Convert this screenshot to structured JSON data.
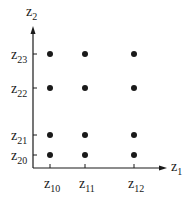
{
  "diagram": {
    "type": "grid-point-lattice",
    "axes": {
      "x": {
        "label_base": "z",
        "label_sub": "1"
      },
      "y": {
        "label_base": "z",
        "label_sub": "2"
      }
    },
    "x_ticks": [
      {
        "base": "z",
        "sub": "10"
      },
      {
        "base": "z",
        "sub": "11"
      },
      {
        "base": "z",
        "sub": "12"
      }
    ],
    "y_ticks": [
      {
        "base": "z",
        "sub": "23"
      },
      {
        "base": "z",
        "sub": "22"
      },
      {
        "base": "z",
        "sub": "21"
      },
      {
        "base": "z",
        "sub": "20"
      }
    ],
    "points": [
      [
        "z10",
        "z23"
      ],
      [
        "z11",
        "z23"
      ],
      [
        "z12",
        "z23"
      ],
      [
        "z10",
        "z22"
      ],
      [
        "z11",
        "z22"
      ],
      [
        "z12",
        "z22"
      ],
      [
        "z10",
        "z21"
      ],
      [
        "z11",
        "z21"
      ],
      [
        "z12",
        "z21"
      ],
      [
        "z10",
        "z20"
      ],
      [
        "z11",
        "z20"
      ],
      [
        "z12",
        "z20"
      ]
    ],
    "colors": {
      "ink": "#1a1a1a",
      "background": "#ffffff"
    }
  }
}
